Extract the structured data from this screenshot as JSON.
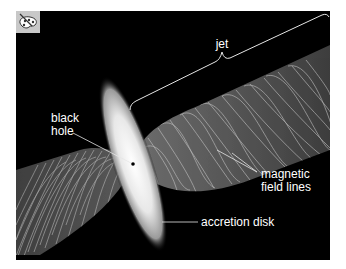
{
  "figure": {
    "background": "#000000",
    "panel": {
      "x": 16,
      "y": 11,
      "width": 314,
      "height": 249
    },
    "icon": "palette-icon",
    "labels": {
      "jet": "jet",
      "black_hole_line1": "black",
      "black_hole_line2": "hole",
      "magnetic_line1": "magnetic",
      "magnetic_line2": "field lines",
      "accretion_disk": "accretion disk"
    },
    "colors": {
      "label": "#ffffff",
      "leader_line": "#e6e6e6",
      "disk_core": "#f4f4f4",
      "jet_fill": "#555555",
      "field_lines": "#bdbdbd"
    }
  }
}
